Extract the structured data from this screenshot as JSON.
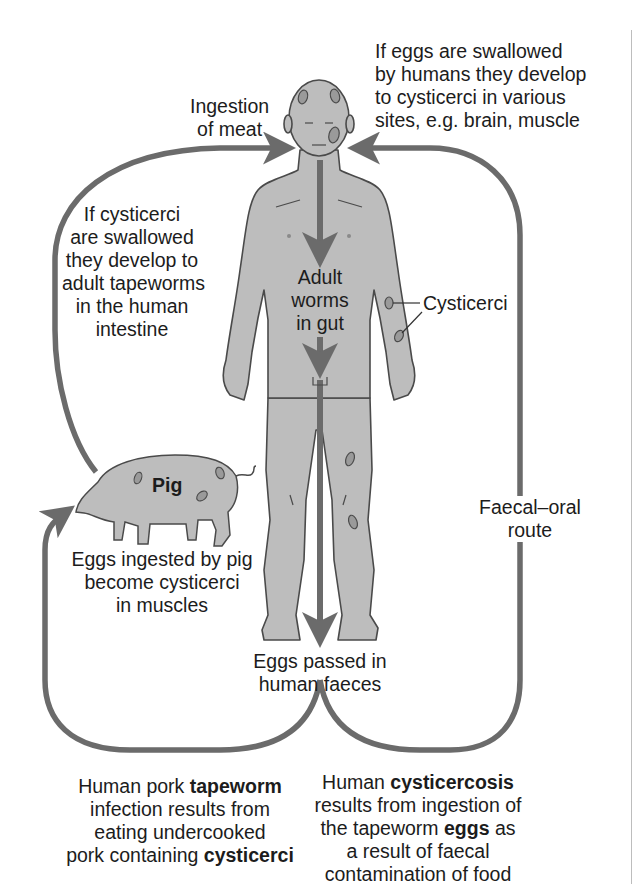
{
  "diagram": {
    "colors": {
      "arrow": "#6b6b6b",
      "body_fill": "#bdbdbd",
      "body_outline": "#4a4a4a",
      "cyst_fill": "#9a9a9a",
      "text": "#1c1c1c",
      "background": "#ffffff"
    },
    "labels": {
      "ingestion": [
        "Ingestion",
        "of meat"
      ],
      "eggs_swallowed": [
        "If eggs are swallowed",
        "by humans they develop",
        "to cysticerci in various",
        "sites, e.g. brain, muscle"
      ],
      "cysticerci_swallowed": [
        "If cysticerci",
        "are swallowed",
        "they develop to",
        "adult tapeworms",
        "in the human",
        "intestine"
      ],
      "adult_worms": [
        "Adult",
        "worms",
        "in gut"
      ],
      "cysticerci_callout": "Cysticerci",
      "pig": "Pig",
      "eggs_ingested_pig": [
        "Eggs ingested by pig",
        "become cysticerci",
        "in muscles"
      ],
      "faecal_oral": [
        "Faecal–oral",
        "route"
      ],
      "eggs_passed": [
        "Eggs passed in",
        "human faeces"
      ]
    },
    "captions": {
      "tapeworm": {
        "l1_pre": "Human pork ",
        "l1_bold": "tapeworm",
        "l2": "infection results from",
        "l3": "eating undercooked",
        "l4_pre": "pork containing ",
        "l4_bold": "cysticerci"
      },
      "cysticercosis": {
        "l1_pre": "Human ",
        "l1_bold": "cysticercosis",
        "l2": "results from ingestion of",
        "l3_pre": "the tapeworm ",
        "l3_bold": "eggs",
        "l3_post": " as",
        "l4": "a result of faecal",
        "l5": "contamination of food"
      }
    }
  }
}
